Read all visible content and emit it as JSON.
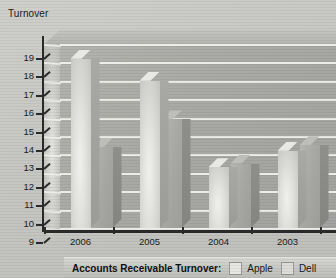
{
  "chart_data": {
    "type": "bar",
    "title": "Turnover",
    "xlabel": "",
    "ylabel": "Turnover",
    "categories": [
      "2006",
      "2005",
      "2004",
      "2003"
    ],
    "ylim": [
      9,
      19
    ],
    "ytick_values": [
      19,
      18,
      17,
      16,
      15,
      14,
      13,
      12,
      11,
      10,
      9
    ],
    "ytick_labels": [
      "19",
      "18",
      "17",
      "16",
      "15",
      "14",
      "13",
      "12",
      "11",
      "10",
      "9"
    ],
    "grid": true,
    "legend_position": "bottom",
    "legend_title": "Accounts Receivable Turnover:",
    "series": [
      {
        "name": "Apple",
        "color": "#e2e2de",
        "values": [
          18.2,
          17.0,
          12.3,
          13.2
        ]
      },
      {
        "name": "Dell",
        "color": "#a6a6a2",
        "values": [
          13.4,
          14.9,
          12.5,
          13.5
        ]
      }
    ]
  },
  "legend": {
    "title": "Accounts Receivable Turnover:",
    "entries": [
      {
        "label": "Apple",
        "swatch": "apple"
      },
      {
        "label": "Dell",
        "swatch": "dell"
      }
    ]
  }
}
